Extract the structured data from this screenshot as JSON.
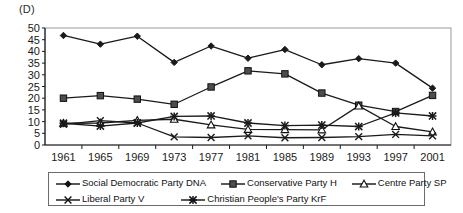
{
  "panel": {
    "label": "(D)"
  },
  "chart_data": {
    "type": "line",
    "title": "(D)",
    "xlabel": "",
    "ylabel": "",
    "x": [
      1961,
      1965,
      1969,
      1973,
      1977,
      1981,
      1985,
      1989,
      1993,
      1997,
      2001
    ],
    "categories": [
      "1961",
      "1965",
      "1969",
      "1973",
      "1977",
      "1981",
      "1985",
      "1989",
      "1993",
      "1997",
      "2001"
    ],
    "ylim": [
      0,
      50
    ],
    "yticks": [
      0,
      5,
      10,
      15,
      20,
      25,
      30,
      35,
      40,
      45,
      50
    ],
    "ytick_labels": [
      "0",
      "5",
      "10",
      "15",
      "20",
      "25",
      "30",
      "35",
      "40",
      "45",
      "50"
    ],
    "grid": false,
    "legend_position": "bottom",
    "series": [
      {
        "name": "Social Democratic Party DNA",
        "marker": "diamond",
        "color": "#1a1a1a",
        "values": [
          46.8,
          43.1,
          46.5,
          35.3,
          42.3,
          37.1,
          40.8,
          34.3,
          36.9,
          35.0,
          24.3
        ]
      },
      {
        "name": "Conservative Party H",
        "marker": "square",
        "color": "#1a1a1a",
        "values": [
          20.0,
          21.1,
          19.6,
          17.4,
          24.8,
          31.7,
          30.4,
          22.2,
          17.0,
          14.3,
          21.2
        ]
      },
      {
        "name": "Centre Party SP",
        "marker": "triangle",
        "color": "#1a1a1a",
        "values": [
          9.3,
          9.4,
          10.5,
          11.0,
          8.6,
          6.7,
          6.6,
          6.5,
          16.7,
          7.9,
          5.6
        ]
      },
      {
        "name": "Liberal Party V",
        "marker": "x",
        "color": "#1a1a1a",
        "values": [
          8.8,
          10.4,
          9.4,
          3.5,
          3.2,
          3.9,
          3.1,
          3.2,
          3.6,
          4.5,
          3.9
        ]
      },
      {
        "name": "Christian People's Party KrF",
        "marker": "star",
        "color": "#1a1a1a",
        "values": [
          9.3,
          8.1,
          9.4,
          12.2,
          12.4,
          9.4,
          8.3,
          8.5,
          7.9,
          13.7,
          12.4
        ]
      }
    ]
  },
  "legend": {
    "rows": [
      [
        {
          "label": "Social Democratic Party DNA",
          "marker": "diamond"
        },
        {
          "label": "Conservative Party H",
          "marker": "square"
        },
        {
          "label": "Centre Party SP",
          "marker": "triangle"
        }
      ],
      [
        {
          "label": "Liberal Party V",
          "marker": "x"
        },
        {
          "label": "Christian People's Party KrF",
          "marker": "star"
        }
      ]
    ]
  }
}
